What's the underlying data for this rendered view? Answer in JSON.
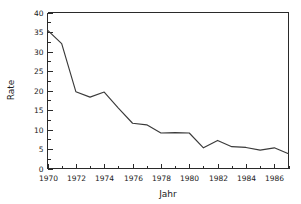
{
  "chart_data": {
    "type": "line",
    "title": "",
    "xlabel": "Jahr",
    "ylabel": "Rate",
    "x": [
      1970,
      1971,
      1972,
      1973,
      1974,
      1975,
      1976,
      1977,
      1978,
      1979,
      1980,
      1981,
      1982,
      1983,
      1984,
      1985,
      1986,
      1987
    ],
    "values": [
      35.5,
      32.0,
      19.7,
      18.3,
      19.6,
      15.5,
      11.6,
      11.2,
      9.1,
      9.2,
      9.1,
      5.3,
      7.2,
      5.6,
      5.4,
      4.7,
      5.3,
      3.8
    ],
    "series": [
      {
        "name": "Rate",
        "values": [
          35.5,
          32.0,
          19.7,
          18.3,
          19.6,
          15.5,
          11.6,
          11.2,
          9.1,
          9.2,
          9.1,
          5.3,
          7.2,
          5.6,
          5.4,
          4.7,
          5.3,
          3.8
        ]
      }
    ],
    "xlim": [
      1970,
      1987
    ],
    "ylim": [
      0,
      40
    ],
    "ytick_values": [
      0,
      5,
      10,
      15,
      20,
      25,
      30,
      35,
      40
    ],
    "ytick_labels": [
      "0",
      "5",
      "10",
      "15",
      "20",
      "25",
      "30",
      "35",
      "40"
    ],
    "xtick_values": [
      1970,
      1972,
      1974,
      1976,
      1978,
      1980,
      1982,
      1984,
      1986
    ],
    "xtick_labels": [
      "1970",
      "1972",
      "1974",
      "1976",
      "1978",
      "1980",
      "1982",
      "1984",
      "1986"
    ],
    "xminor_step": 1,
    "yminor_step": 2.5,
    "grid": false,
    "legend": false,
    "legend_position": "none",
    "line_color": "#3a3a3a",
    "axis_color": "#2a2a2a",
    "background_color": "#ffffff"
  }
}
